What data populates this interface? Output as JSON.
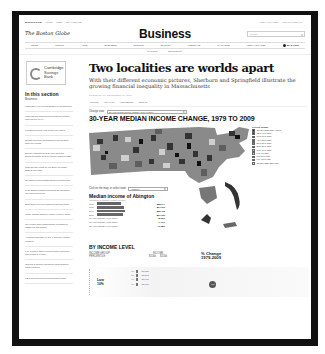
{
  "topbar": {
    "brand": "BOSTON.COM",
    "links": [
      "HOME",
      "JOBS",
      "REAL ESTATE"
    ],
    "right_links": [
      "TODAY'S PAPER",
      "LOG IN / SIGN UP"
    ]
  },
  "masthead": {
    "logo": "The Boston Globe",
    "section_title": "Business",
    "search_placeholder": "Search",
    "search_icon": "magnifier-icon"
  },
  "nav": {
    "items": [
      "NEWS",
      "METRO",
      "ARTS",
      "BUSINESS",
      "SPORTS",
      "OPINION",
      "LIFESTYLE",
      "MAGAZINE",
      "TODAY'S PAPER"
    ],
    "saved_label": "MY SAVED"
  },
  "subnav": {
    "items": [
      "MARKETS",
      "TECHNOLOGY"
    ]
  },
  "sidebar": {
    "ad": {
      "line1": "Cambridge",
      "line2": "Savings",
      "line3": "Bank"
    },
    "heading": "In this section",
    "subheading": "Business",
    "items": [
      "Motorists eyes on just Boston T-92 tamerger",
      "Mass Dept's Commercial funds for trusted loan payroll in MA",
      "Pipestock joined IPO at $66 per share",
      "Stocks continue downward trend as Dow falls 198 points",
      "Energy firms Reaves Dynon says the smallest hedge sets to Pilgrim nuclear plant",
      "Jobless rate holds to low 2009 as Mass. adds 2,600 jobs",
      "RJ official counters$aid Boring controversy",
      "Keith Bakes resigns following $8 Readers' irreverent payment",
      "Enterprise buys on fostering special mom",
      "Mass. adopts NCSI in inquiry fresh in 2011",
      "GM report rises as Berkshire investment passes to big picture",
      "Avoiding marriage in No. 1 unfilled Homes Incident",
      "L.C. Penney stock declines after reducing sales lead to a loan",
      "Test says women members must support further saving",
      "US prices hit feeling as surprises grow"
    ]
  },
  "article": {
    "headline": "Two localities are worlds apart",
    "dek": "With their different economic pictures, Sherborn and Springfield illustrate the growing financial inequality in Massachusetts",
    "byline": "GLOBE STAFF   DECEMBER 18, 2011",
    "tools": [
      "ARTICLE",
      "GRAPHIC",
      "COMMENTS",
      "SIGN IN"
    ]
  },
  "graphic": {
    "change_view_label": "Change view:",
    "change_view_value": "30-year median income change, 1979 to 2009",
    "title": "30-YEAR MEDIAN INCOME CHANGE, 1979 TO 2009",
    "legend": {
      "title": "Percent change",
      "items": [
        {
          "label": "Greater than than +100%",
          "color": "#111111"
        },
        {
          "label": "75 to 99% gain",
          "color": "#333333"
        },
        {
          "label": "60 to 89% gain",
          "color": "#4d4d4d"
        },
        {
          "label": "40 to 59% gain",
          "color": "#666666"
        },
        {
          "label": "30 to 39% gain",
          "color": "#808080"
        },
        {
          "label": "20 to 29% gain",
          "color": "#999999"
        },
        {
          "label": "10 to 19% gain",
          "color": "#bbbbbb"
        },
        {
          "label": "0 to 9% gain",
          "color": "#dddddd"
        },
        {
          "label": "0 to 19% loss",
          "color": "#f2f2f2"
        },
        {
          "label": "0 to -59% loss",
          "color": "#ffffff"
        },
        {
          "label": "Greater than 20% loss",
          "color": "#e6e6e6"
        }
      ]
    },
    "select_town_label": "Click on the map, or select town:",
    "select_town_value": "Abington",
    "town_heading": "Median income of Abington",
    "town_subheading": "(adjusted for inflation, in 2009 dollars)",
    "town_rows": [
      {
        "label": "1979",
        "value": "$55,644",
        "bar": 44
      },
      {
        "label": "1989",
        "value": "$64,079",
        "bar": 48
      },
      {
        "label": "1999",
        "value": "$66,790",
        "bar": 50
      },
      {
        "label": "2009",
        "value": "$61,157",
        "bar": 46
      }
    ],
    "town_changes": [
      {
        "label": "10-year change (1999-2009)",
        "value": "-8.99%"
      },
      {
        "label": "20-year change (1989-2009)",
        "value": "-7.71%"
      },
      {
        "label": "30-year change (1979-2009)",
        "value": "+6.38%"
      }
    ]
  },
  "by_income": {
    "heading": "BY INCOME LEVEL",
    "col_group": "INCOME GROUP",
    "col_percentile": "PERCENTILE",
    "col_income": "INCOME",
    "col_income_low": "$100k",
    "col_income_high": "$200k",
    "col_change_line1": "% Change",
    "col_change_line2": "1979-2009",
    "group_label_line1": "Low",
    "group_label_line2": "10%",
    "rows": [
      {
        "year": "79",
        "value": "23,526"
      },
      {
        "year": "89",
        "value": "23,293"
      },
      {
        "year": "99",
        "value": "23,788"
      },
      {
        "year": "09",
        "value": "22,700"
      }
    ],
    "change_badge": "-3.5%"
  }
}
